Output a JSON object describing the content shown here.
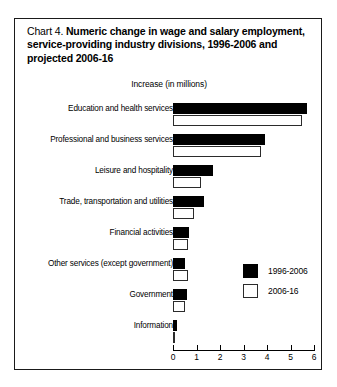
{
  "chart": {
    "number_prefix": "Chart 4.",
    "title": "Numeric change in wage and salary employment, service-providing industry divisions, 1996-2006 and projected 2006-16",
    "axis_title": "Increase (in millions)",
    "legend": [
      {
        "label": "1996-2006",
        "swatch": "black-filled-swatch"
      },
      {
        "label": "2006-16",
        "swatch": "white-outlined-swatch"
      }
    ],
    "x_ticks": [
      "0",
      "1",
      "2",
      "3",
      "4",
      "5",
      "6"
    ]
  },
  "chart_data": {
    "type": "bar",
    "orientation": "horizontal",
    "title": "Chart 4. Numeric change in wage and salary employment, service-providing industry divisions, 1996-2006 and projected 2006-16",
    "xlabel": "Increase (in millions)",
    "ylabel": "",
    "xlim": [
      0,
      6
    ],
    "xticks": [
      0,
      1,
      2,
      3,
      4,
      5,
      6
    ],
    "grid": false,
    "legend_position": "middle-right",
    "categories": [
      "Education and health services",
      "Professional and business services",
      "Leisure and hospitality",
      "Trade, transportation and utilities",
      "Financial activities",
      "Other services (except government)",
      "Government",
      "Information"
    ],
    "series": [
      {
        "name": "1996-2006",
        "color": "#000000",
        "values": [
          5.7,
          3.9,
          1.7,
          1.3,
          0.7,
          0.5,
          0.6,
          0.15
        ]
      },
      {
        "name": "2006-16",
        "color": "#ffffff",
        "values": [
          5.5,
          3.75,
          1.2,
          0.9,
          0.65,
          0.65,
          0.5,
          0.1
        ]
      }
    ]
  }
}
